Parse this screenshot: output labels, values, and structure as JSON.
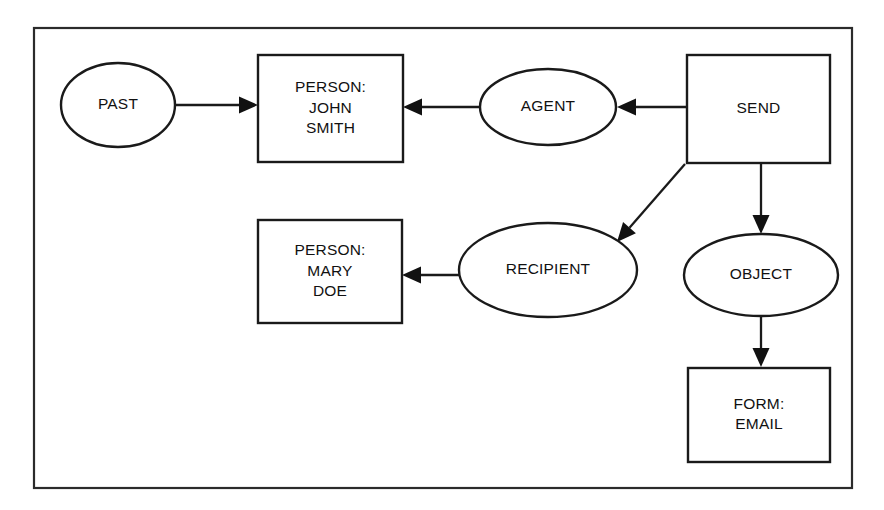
{
  "diagram": {
    "type": "semantic-network",
    "frame": {
      "x": 34,
      "y": 28,
      "width": 818,
      "height": 460
    },
    "nodes": [
      {
        "id": "past",
        "shape": "ellipse",
        "name": "node-past",
        "label_lines": [
          "PAST"
        ],
        "cx": 118,
        "cy": 105,
        "rx": 57,
        "ry": 42
      },
      {
        "id": "person-john-smith",
        "shape": "rect",
        "name": "node-person-john-smith",
        "label_lines": [
          "PERSON:",
          "JOHN",
          "SMITH"
        ],
        "x": 258,
        "y": 55,
        "width": 145,
        "height": 107
      },
      {
        "id": "agent",
        "shape": "ellipse",
        "name": "node-agent",
        "label_lines": [
          "AGENT"
        ],
        "cx": 548,
        "cy": 107,
        "rx": 68,
        "ry": 38
      },
      {
        "id": "send",
        "shape": "rect",
        "name": "node-send",
        "label_lines": [
          "SEND"
        ],
        "x": 687,
        "y": 55,
        "width": 143,
        "height": 108
      },
      {
        "id": "person-mary-doe",
        "shape": "rect",
        "name": "node-person-mary-doe",
        "label_lines": [
          "PERSON:",
          "MARY",
          "DOE"
        ],
        "x": 258,
        "y": 220,
        "width": 144,
        "height": 103
      },
      {
        "id": "recipient",
        "shape": "ellipse",
        "name": "node-recipient",
        "label_lines": [
          "RECIPIENT"
        ],
        "cx": 548,
        "cy": 270,
        "rx": 89,
        "ry": 47
      },
      {
        "id": "object",
        "shape": "ellipse",
        "name": "node-object",
        "label_lines": [
          "OBJECT"
        ],
        "cx": 761,
        "cy": 275,
        "rx": 77,
        "ry": 41
      },
      {
        "id": "form-email",
        "shape": "rect",
        "name": "node-form-email",
        "label_lines": [
          "FORM:",
          "EMAIL"
        ],
        "x": 688,
        "y": 368,
        "width": 142,
        "height": 94
      }
    ],
    "edges": [
      {
        "id": "past-to-john-smith",
        "name": "edge-past-to-person-john-smith",
        "from": "past",
        "to": "person-john-smith",
        "direction": "right",
        "line": {
          "x1": 175,
          "y1": 105,
          "x2": 258,
          "y2": 105
        }
      },
      {
        "id": "agent-to-john-smith",
        "name": "edge-agent-to-person-john-smith",
        "from": "agent",
        "to": "person-john-smith",
        "direction": "left",
        "line": {
          "x1": 480,
          "y1": 107,
          "x2": 403,
          "y2": 107
        }
      },
      {
        "id": "send-to-agent",
        "name": "edge-send-to-agent",
        "from": "send",
        "to": "agent",
        "direction": "left",
        "line": {
          "x1": 687,
          "y1": 107,
          "x2": 617,
          "y2": 107
        }
      },
      {
        "id": "send-to-recipient",
        "name": "edge-send-to-recipient",
        "from": "send",
        "to": "recipient",
        "direction": "diagonal-down-left",
        "line": {
          "x1": 685,
          "y1": 164,
          "x2": 617,
          "y2": 242
        }
      },
      {
        "id": "send-to-object",
        "name": "edge-send-to-object",
        "from": "send",
        "to": "object",
        "direction": "down",
        "line": {
          "x1": 761,
          "y1": 163,
          "x2": 761,
          "y2": 234
        }
      },
      {
        "id": "recipient-to-mary-doe",
        "name": "edge-recipient-to-person-mary-doe",
        "from": "recipient",
        "to": "person-mary-doe",
        "direction": "left",
        "line": {
          "x1": 459,
          "y1": 275,
          "x2": 402,
          "y2": 275
        }
      },
      {
        "id": "object-to-form-email",
        "name": "edge-object-to-form-email",
        "from": "object",
        "to": "form-email",
        "direction": "down",
        "line": {
          "x1": 761,
          "y1": 316,
          "x2": 761,
          "y2": 367
        }
      }
    ],
    "colors": {
      "background": "#ffffff",
      "stroke": "#1a1a1a",
      "frame_stroke": "#2b2b2b",
      "text": "#111111",
      "arrow_fill": "#111111"
    }
  }
}
